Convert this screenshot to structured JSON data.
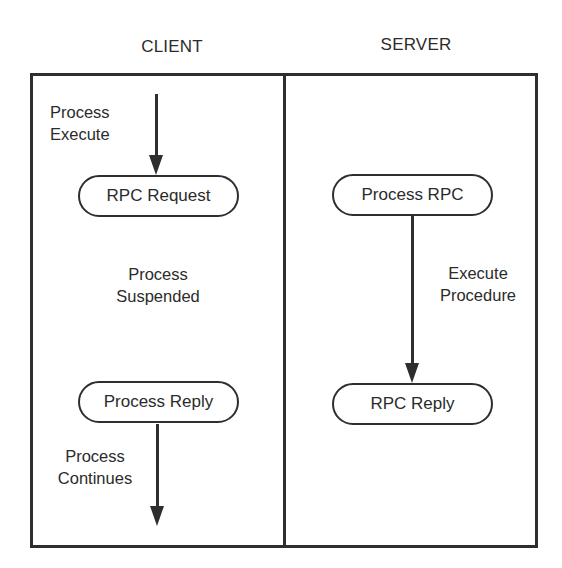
{
  "diagram": {
    "type": "rpc-sequence",
    "columns": [
      {
        "id": "client",
        "title": "CLIENT"
      },
      {
        "id": "server",
        "title": "SERVER"
      }
    ],
    "client": {
      "start_label": {
        "line1": "Process",
        "line2": "Execute"
      },
      "request_node": "RPC Request",
      "suspended_label": {
        "line1": "Process",
        "line2": "Suspended"
      },
      "reply_node": "Process Reply",
      "continue_label": {
        "line1": "Process",
        "line2": "Continues"
      }
    },
    "server": {
      "process_node": "Process RPC",
      "execute_label": {
        "line1": "Execute",
        "line2": "Procedure"
      },
      "reply_node": "RPC Reply"
    },
    "edges": [
      {
        "from": "client-start",
        "to": "RPC Request",
        "label": "Process Execute"
      },
      {
        "from": "Process RPC",
        "to": "RPC Reply",
        "label": "Execute Procedure"
      },
      {
        "from": "Process Reply",
        "to": "client-end",
        "label": "Process Continues"
      }
    ],
    "colors": {
      "stroke": "#2e2e2e",
      "text": "#2b2b2b",
      "background": "#ffffff"
    }
  }
}
